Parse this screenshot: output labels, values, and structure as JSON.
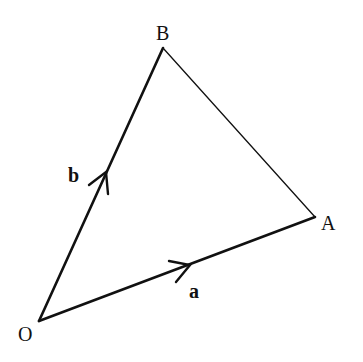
{
  "diagram": {
    "type": "vector-triangle",
    "colors": {
      "background": "#ffffff",
      "stroke": "#111111"
    },
    "points": {
      "O": {
        "label": "O",
        "x": 39,
        "y": 321
      },
      "A": {
        "label": "A",
        "x": 315,
        "y": 217
      },
      "B": {
        "label": "B",
        "x": 163,
        "y": 48
      }
    },
    "vertex_labels": {
      "O": "O",
      "A": "A",
      "B": "B"
    },
    "vectors": [
      {
        "from": "O",
        "to": "A",
        "label": "a",
        "bold": true,
        "arrow": true
      },
      {
        "from": "O",
        "to": "B",
        "label": "b",
        "bold": true,
        "arrow": true
      }
    ],
    "segments": [
      {
        "from": "B",
        "to": "A",
        "arrow": false
      }
    ],
    "vector_labels": {
      "a": "a",
      "b": "b"
    }
  }
}
